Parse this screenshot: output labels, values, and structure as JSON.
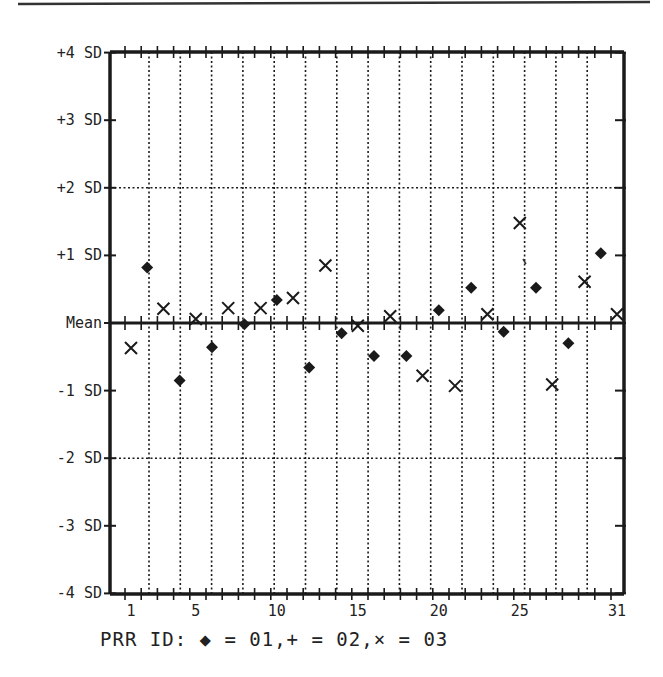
{
  "chart_data": {
    "type": "scatter",
    "title": "",
    "xlabel": "",
    "ylabel": "",
    "x_range": [
      1,
      31
    ],
    "y_range": [
      -4,
      4
    ],
    "grid": true,
    "x_tick_labels": [
      {
        "x": 1,
        "label": "1"
      },
      {
        "x": 5,
        "label": "5"
      },
      {
        "x": 10,
        "label": "10"
      },
      {
        "x": 15,
        "label": "15"
      },
      {
        "x": 20,
        "label": "20"
      },
      {
        "x": 25,
        "label": "25"
      },
      {
        "x": 31,
        "label": "31"
      }
    ],
    "y_tick_labels": [
      {
        "y": 4,
        "label": "+4 SD"
      },
      {
        "y": 3,
        "label": "+3 SD"
      },
      {
        "y": 2,
        "label": "+2 SD"
      },
      {
        "y": 1,
        "label": "+1 SD"
      },
      {
        "y": 0,
        "label": "Mean"
      },
      {
        "y": -1,
        "label": "-1 SD"
      },
      {
        "y": -2,
        "label": "-2 SD"
      },
      {
        "y": -3,
        "label": "-3 SD"
      },
      {
        "y": -4,
        "label": "-4 SD"
      }
    ],
    "legend_text": "PRR ID: ◆ = 01,+ = 02,× = 03",
    "legend_position": "bottom",
    "series": [
      {
        "name": "01",
        "marker": "diamond",
        "points": [
          {
            "x": 2,
            "y": 0.82
          },
          {
            "x": 4,
            "y": -0.85
          },
          {
            "x": 6,
            "y": -0.36
          },
          {
            "x": 8,
            "y": -0.02
          },
          {
            "x": 10,
            "y": 0.34
          },
          {
            "x": 12,
            "y": -0.66
          },
          {
            "x": 14,
            "y": -0.15
          },
          {
            "x": 16,
            "y": -0.49
          },
          {
            "x": 18,
            "y": -0.49
          },
          {
            "x": 20,
            "y": 0.19
          },
          {
            "x": 22,
            "y": 0.52
          },
          {
            "x": 24,
            "y": -0.13
          },
          {
            "x": 26,
            "y": 0.52
          },
          {
            "x": 28,
            "y": -0.3
          },
          {
            "x": 30,
            "y": 1.03
          }
        ]
      },
      {
        "name": "02",
        "marker": "plus",
        "points": []
      },
      {
        "name": "03",
        "marker": "x",
        "points": [
          {
            "x": 1,
            "y": -0.37
          },
          {
            "x": 3,
            "y": 0.21
          },
          {
            "x": 5,
            "y": 0.06
          },
          {
            "x": 7,
            "y": 0.22
          },
          {
            "x": 9,
            "y": 0.22
          },
          {
            "x": 11,
            "y": 0.37
          },
          {
            "x": 13,
            "y": 0.85
          },
          {
            "x": 15,
            "y": -0.04
          },
          {
            "x": 17,
            "y": 0.1
          },
          {
            "x": 19,
            "y": -0.78
          },
          {
            "x": 21,
            "y": -0.93
          },
          {
            "x": 23,
            "y": 0.13
          },
          {
            "x": 25,
            "y": 1.48
          },
          {
            "x": 27,
            "y": -0.91
          },
          {
            "x": 29,
            "y": 0.61
          },
          {
            "x": 31,
            "y": 0.13
          }
        ]
      }
    ]
  },
  "colors": {
    "ink": "#1a1a1a",
    "background": "#ffffff"
  }
}
